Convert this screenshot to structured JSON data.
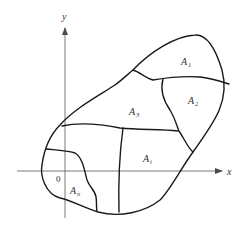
{
  "diagram": {
    "axes": {
      "x_label": "x",
      "y_label": "y",
      "origin_label": "0"
    },
    "regions": [
      {
        "id": "A1",
        "base": "A",
        "sub": "1"
      },
      {
        "id": "A2",
        "base": "A",
        "sub": "2"
      },
      {
        "id": "A3",
        "base": "A",
        "sub": "3"
      },
      {
        "id": "Ai",
        "base": "A",
        "sub": "i"
      },
      {
        "id": "An",
        "base": "A",
        "sub": "n"
      }
    ],
    "colors": {
      "curve": "#1a1a1a",
      "axis": "#6a6a6a",
      "text": "#333333"
    }
  }
}
